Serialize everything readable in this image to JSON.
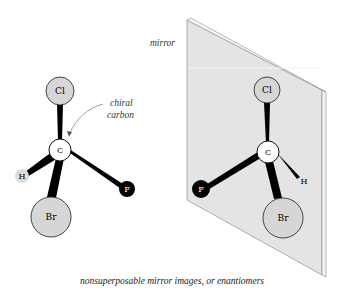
{
  "diagram": {
    "caption": "nonsuperposable mirror images, or enantiomers",
    "mirror_label": "mirror",
    "annotation": {
      "line1": "chiral",
      "line2": "carbon"
    },
    "colors": {
      "mirror_fill": "#e4e4e4",
      "mirror_edge": "#bdbdbd",
      "halogen_fill": "#d6d6d6",
      "fluorine_fill": "#000000",
      "carbon_fill": "#ffffff",
      "hydrogen_fill": "#dcdcdc",
      "bond": "#000000"
    },
    "left_molecule": {
      "atoms": {
        "cl": "Cl",
        "c": "C",
        "h": "H",
        "br": "Br",
        "f": "F"
      }
    },
    "right_molecule": {
      "atoms": {
        "cl": "Cl",
        "c": "C",
        "h": "H",
        "br": "Br",
        "f": "F"
      }
    }
  }
}
